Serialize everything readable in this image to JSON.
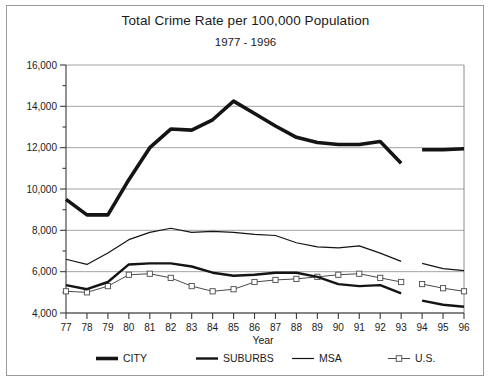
{
  "title": "Total Crime Rate per 100,000 Population",
  "subtitle": "1977 - 1996",
  "axis": {
    "xlabel": "Year",
    "ylabel": ""
  },
  "legend": {
    "items": [
      {
        "label": "CITY",
        "key": "city",
        "marker": "thick-line"
      },
      {
        "label": "SUBURBS",
        "key": "suburbs",
        "marker": "medium-line"
      },
      {
        "label": "MSA",
        "key": "msa",
        "marker": "thin-line"
      },
      {
        "label": "U.S.",
        "key": "us",
        "marker": "thin-line-square"
      }
    ]
  },
  "ytick_labels": [
    "16,000",
    "14,000",
    "12,000",
    "10,000",
    "8,000",
    "6,000",
    "4,000"
  ],
  "xtick_labels": [
    "77",
    "78",
    "79",
    "80",
    "81",
    "82",
    "83",
    "84",
    "85",
    "86",
    "87",
    "88",
    "89",
    "90",
    "91",
    "92",
    "93",
    "94",
    "95",
    "96"
  ],
  "chart_data": {
    "type": "line",
    "title": "Total Crime Rate per 100,000 Population",
    "subtitle": "1977 - 1996",
    "xlabel": "Year",
    "ylabel": "",
    "xlim": [
      77,
      96
    ],
    "ylim": [
      4000,
      16000
    ],
    "ytick_values": [
      16000,
      14000,
      12000,
      10000,
      8000,
      6000,
      4000
    ],
    "yminor_step": 1000,
    "grid": "horizontal",
    "legend_position": "bottom",
    "categories": [
      77,
      78,
      79,
      80,
      81,
      82,
      83,
      84,
      85,
      86,
      87,
      88,
      89,
      90,
      91,
      92,
      93,
      94,
      95,
      96
    ],
    "series": [
      {
        "name": "CITY",
        "color": "#141414",
        "width": 3.6,
        "values": [
          9500,
          8750,
          8750,
          10450,
          12000,
          12900,
          12850,
          13350,
          14250,
          13650,
          13050,
          12500,
          12250,
          12150,
          12150,
          12300,
          11250,
          null,
          null,
          null
        ],
        "segments": [
          {
            "x": [
              77,
              78,
              79,
              80,
              81,
              82,
              83,
              84,
              85,
              86,
              87,
              88,
              89,
              90,
              91,
              92,
              93
            ],
            "y": [
              9500,
              8750,
              8750,
              10450,
              12000,
              12900,
              12850,
              13350,
              14250,
              13650,
              13050,
              12500,
              12250,
              12150,
              12150,
              12300,
              11250
            ]
          },
          {
            "x": [
              94,
              95,
              96
            ],
            "y": [
              11900,
              11900,
              11950
            ]
          }
        ]
      },
      {
        "name": "SUBURBS",
        "color": "#141414",
        "width": 2.4,
        "values": [
          5350,
          5150,
          5500,
          6350,
          6400,
          6400,
          6250,
          5950,
          5800,
          5850,
          5950,
          5950,
          5750,
          5400,
          5300,
          5350,
          4950,
          null,
          null,
          null
        ],
        "segments": [
          {
            "x": [
              77,
              78,
              79,
              80,
              81,
              82,
              83,
              84,
              85,
              86,
              87,
              88,
              89,
              90,
              91,
              92,
              93
            ],
            "y": [
              5350,
              5150,
              5500,
              6350,
              6400,
              6400,
              6250,
              5950,
              5800,
              5850,
              5950,
              5950,
              5750,
              5400,
              5300,
              5350,
              4950
            ]
          },
          {
            "x": [
              94,
              95,
              96
            ],
            "y": [
              4600,
              4400,
              4300
            ]
          }
        ]
      },
      {
        "name": "MSA",
        "color": "#141414",
        "width": 1.2,
        "values": [
          6600,
          6350,
          6900,
          7550,
          7900,
          8100,
          7900,
          7950,
          7900,
          7800,
          7750,
          7400,
          7200,
          7150,
          7250,
          6900,
          6500,
          null,
          null,
          null
        ],
        "segments": [
          {
            "x": [
              77,
              78,
              79,
              80,
              81,
              82,
              83,
              84,
              85,
              86,
              87,
              88,
              89,
              90,
              91,
              92,
              93
            ],
            "y": [
              6600,
              6350,
              6900,
              7550,
              7900,
              8100,
              7900,
              7950,
              7900,
              7800,
              7750,
              7400,
              7200,
              7150,
              7250,
              6900,
              6500
            ]
          },
          {
            "x": [
              94,
              95,
              96
            ],
            "y": [
              6400,
              6150,
              6050
            ]
          }
        ]
      },
      {
        "name": "U.S.",
        "color": "#4a4a4a",
        "width": 1.0,
        "marker": "open-square",
        "values": [
          5050,
          5000,
          5300,
          5850,
          5900,
          5700,
          5300,
          5050,
          5150,
          5500,
          5600,
          5650,
          5750,
          5850,
          5900,
          5700,
          5500,
          5400,
          5200,
          5050
        ],
        "segments": [
          {
            "x": [
              77,
              78,
              79,
              80,
              81,
              82,
              83,
              84,
              85,
              86,
              87,
              88,
              89,
              90,
              91,
              92,
              93
            ],
            "y": [
              5050,
              5000,
              5300,
              5850,
              5900,
              5700,
              5300,
              5050,
              5150,
              5500,
              5600,
              5650,
              5750,
              5850,
              5900,
              5700,
              5500
            ]
          },
          {
            "x": [
              94,
              95,
              96
            ],
            "y": [
              5400,
              5200,
              5050
            ]
          }
        ]
      }
    ]
  }
}
